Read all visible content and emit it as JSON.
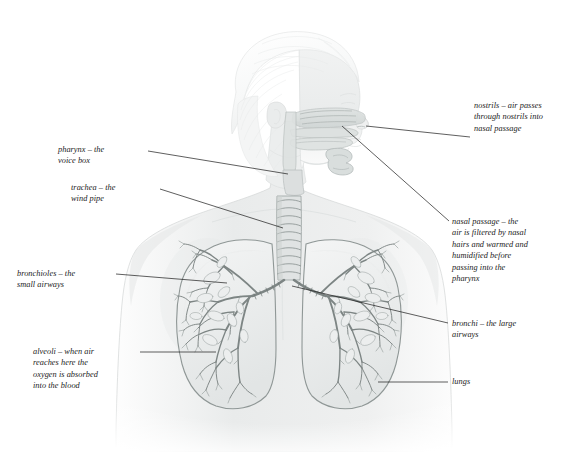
{
  "figure": {
    "style": "pencil-shaded anatomical illustration",
    "background_color": "#ffffff",
    "line_color": "#1a1a1a",
    "body_tone": "#eceded",
    "organ_tone": "#d8dcdb"
  },
  "labels": {
    "nostrils": {
      "text": "nostrils – air passes\nthrough nostrils into\nnasal passage",
      "name": "nostrils"
    },
    "nasal_passage": {
      "text": "nasal passage – the\nair is filtered by nasal\nhairs and warmed and\nhumidified before\npassing into the\npharynx",
      "name": "nasal passage"
    },
    "pharynx": {
      "text": "pharynx – the\nvoice box",
      "name": "pharynx"
    },
    "trachea": {
      "text": "trachea – the\nwind pipe",
      "name": "trachea"
    },
    "bronchioles": {
      "text": "bronchioles – the\nsmall airways",
      "name": "bronchioles"
    },
    "alveoli": {
      "text": "alveoli – when air\nreaches here the\noxygen is absorbed\ninto the blood",
      "name": "alveoli"
    },
    "bronchi": {
      "text": "bronchi – the large\nairways",
      "name": "bronchi"
    },
    "lungs": {
      "text": "lungs",
      "name": "lungs"
    }
  }
}
